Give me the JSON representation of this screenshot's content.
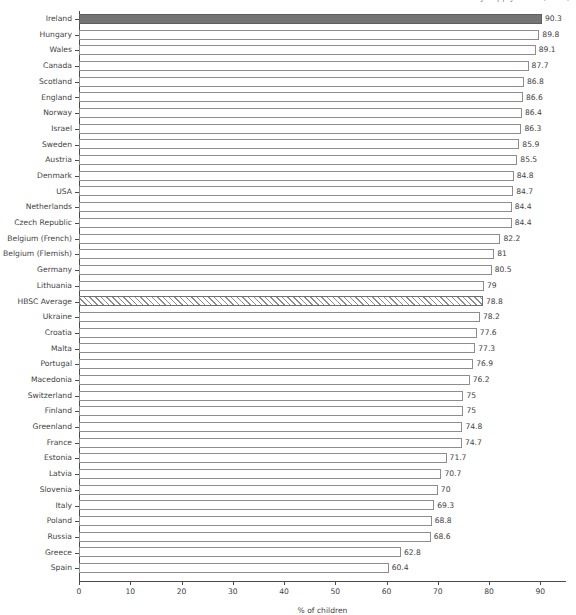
{
  "chart_data": {
    "type": "bar",
    "orientation": "horizontal",
    "title": "by supply hours (2014)",
    "title_clipped": true,
    "xlabel": "% of children",
    "ylabel": "",
    "xlim": [
      0,
      95
    ],
    "xticks": [
      0,
      10,
      20,
      30,
      40,
      50,
      60,
      70,
      80,
      90
    ],
    "grid": false,
    "legend": "none",
    "categories": [
      "Ireland",
      "Hungary",
      "Wales",
      "Canada",
      "Scotland",
      "England",
      "Norway",
      "Israel",
      "Sweden",
      "Austria",
      "Denmark",
      "USA",
      "Netherlands",
      "Czech Republic",
      "Belgium (French)",
      "Belgium (Flemish)",
      "Germany",
      "Lithuania",
      "HBSC Average",
      "Ukraine",
      "Croatia",
      "Malta",
      "Portugal",
      "Macedonia",
      "Switzerland",
      "Finland",
      "Greenland",
      "France",
      "Estonia",
      "Latvia",
      "Slovenia",
      "Italy",
      "Poland",
      "Russia",
      "Greece",
      "Spain"
    ],
    "values": [
      90.3,
      89.8,
      89.1,
      87.7,
      86.8,
      86.6,
      86.4,
      86.3,
      85.9,
      85.5,
      84.8,
      84.7,
      84.4,
      84.4,
      82.2,
      81,
      80.5,
      79,
      78.8,
      78.2,
      77.6,
      77.3,
      76.9,
      76.2,
      75,
      75,
      74.8,
      74.7,
      71.7,
      70.7,
      70,
      69.3,
      68.8,
      68.6,
      62.8,
      60.4
    ],
    "value_labels": [
      "90.3",
      "89.8",
      "89.1",
      "87.7",
      "86.8",
      "86.6",
      "86.4",
      "86.3",
      "85.9",
      "85.5",
      "84.8",
      "84.7",
      "84.4",
      "84.4",
      "82.2",
      "81",
      "80.5",
      "79",
      "78.8",
      "78.2",
      "77.6",
      "77.3",
      "76.9",
      "76.2",
      "75",
      "75",
      "74.8",
      "74.7",
      "71.7",
      "70.7",
      "70",
      "69.3",
      "68.8",
      "68.6",
      "62.8",
      "60.4"
    ],
    "styles": [
      "solid",
      "open",
      "open",
      "open",
      "open",
      "open",
      "open",
      "open",
      "open",
      "open",
      "open",
      "open",
      "open",
      "open",
      "open",
      "open",
      "open",
      "open",
      "hatch",
      "open",
      "open",
      "open",
      "open",
      "open",
      "open",
      "open",
      "open",
      "open",
      "open",
      "open",
      "open",
      "open",
      "open",
      "open",
      "open",
      "open"
    ],
    "colors": {
      "highlight_fill": "#747474",
      "bar_outline": "#8d8d8d",
      "bar_fill": "#ffffff",
      "hatch_stroke": "#8d8d8d",
      "axis": "#4a4a4a",
      "text": "#3f3f3f",
      "background": "#ffffff"
    }
  }
}
